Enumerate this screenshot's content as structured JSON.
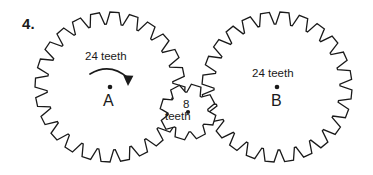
{
  "document": {
    "problem_number": "4.",
    "background_color": "#ffffff",
    "ink_color": "#1a1a1a",
    "width": 373,
    "height": 175
  },
  "gears": [
    {
      "id": "gear-a",
      "name_label": "A",
      "teeth_label": "24 teeth",
      "teeth_count": 24,
      "center_x": 110,
      "center_y": 87,
      "outer_radius": 75,
      "root_radius": 63,
      "rotation_indicator": "clockwise-arrow",
      "has_center_dot": true
    },
    {
      "id": "gear-c",
      "name_label": "",
      "teeth_label_line1": "8",
      "teeth_label_line2": "teeth",
      "teeth_count": 8,
      "center_x": 188,
      "center_y": 112,
      "outer_radius": 28,
      "root_radius": 20,
      "rotation_indicator": "none",
      "has_center_dot": true
    },
    {
      "id": "gear-b",
      "name_label": "B",
      "teeth_label": "24 teeth",
      "teeth_count": 24,
      "center_x": 277,
      "center_y": 87,
      "outer_radius": 75,
      "root_radius": 63,
      "rotation_indicator": "none",
      "has_center_dot": true
    }
  ],
  "annotations": {
    "arrow_name": "clockwise-rotation-arrow",
    "arrow_direction": "clockwise"
  }
}
